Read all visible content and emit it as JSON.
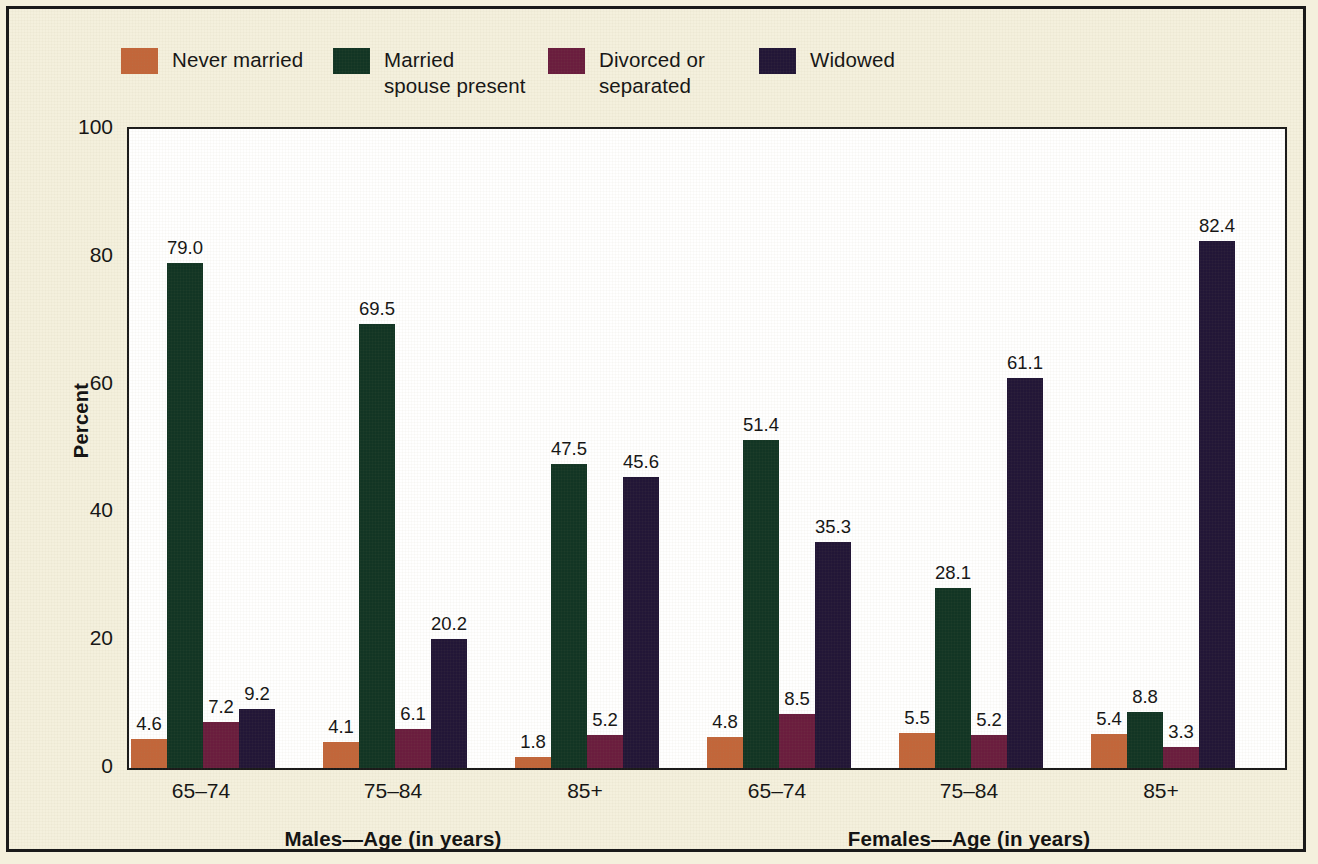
{
  "legend": {
    "items": [
      {
        "label": "Never married",
        "color": "#c2663a"
      },
      {
        "label": "Married\nspouse present",
        "color": "#123524"
      },
      {
        "label": "Divorced or\nseparated",
        "color": "#6a1d3e"
      },
      {
        "label": "Widowed",
        "color": "#221637"
      }
    ]
  },
  "chart_data": {
    "type": "bar",
    "title": "",
    "xlabel": "",
    "ylabel": "Percent",
    "ylim": [
      0,
      100
    ],
    "yticks": [
      0,
      20,
      40,
      60,
      80,
      100
    ],
    "ytick_labels": [
      "0",
      "20",
      "40",
      "60",
      "80",
      "100"
    ],
    "grid": false,
    "legend_position": "top",
    "panels": [
      {
        "name": "Males",
        "axis_label": "Males—Age (in years)"
      },
      {
        "name": "Females",
        "axis_label": "Females—Age (in years)"
      }
    ],
    "categories": [
      "Males 65–74",
      "Males 75–84",
      "Males 85+",
      "Females 65–74",
      "Females 75–84",
      "Females 85+"
    ],
    "category_labels": [
      "65–74",
      "75–84",
      "85+",
      "65–74",
      "75–84",
      "85+"
    ],
    "series": [
      {
        "name": "Never married",
        "color": "#c2663a",
        "values": [
          4.6,
          4.1,
          1.8,
          4.8,
          5.5,
          5.4
        ]
      },
      {
        "name": "Married spouse present",
        "color": "#123524",
        "values": [
          79.0,
          69.5,
          47.5,
          51.4,
          28.1,
          8.8
        ]
      },
      {
        "name": "Divorced or separated",
        "color": "#6a1d3e",
        "values": [
          7.2,
          6.1,
          5.2,
          8.5,
          5.2,
          3.3
        ]
      },
      {
        "name": "Widowed",
        "color": "#221637",
        "values": [
          9.2,
          20.2,
          45.6,
          35.3,
          61.1,
          82.4
        ]
      }
    ],
    "value_labels": [
      [
        "4.6",
        "79.0",
        "7.2",
        "9.2"
      ],
      [
        "4.1",
        "69.5",
        "6.1",
        "20.2"
      ],
      [
        "1.8",
        "47.5",
        "5.2",
        "45.6"
      ],
      [
        "4.8",
        "51.4",
        "8.5",
        "35.3"
      ],
      [
        "5.5",
        "28.1",
        "5.2",
        "61.1"
      ],
      [
        "5.4",
        "8.8",
        "3.3",
        "82.4"
      ]
    ]
  },
  "colors": {
    "page_background": "#f4f0dd",
    "frame": "#1a1a1a",
    "plot_background": "#ffffff",
    "text": "#141414"
  }
}
